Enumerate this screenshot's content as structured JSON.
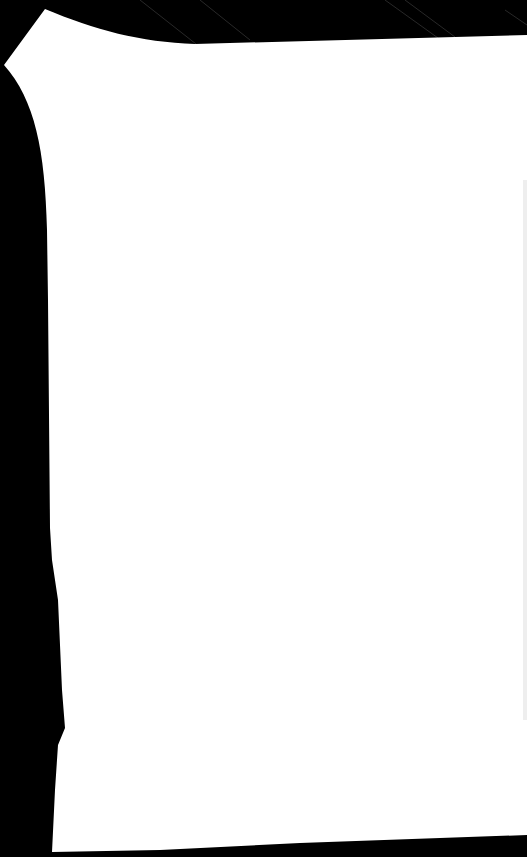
{
  "scene": {
    "background_color": "#000000",
    "shape_color": "#ffffff",
    "streak_color": "#3a3a3a",
    "description": "White irregular sheet silhouette on black background"
  }
}
